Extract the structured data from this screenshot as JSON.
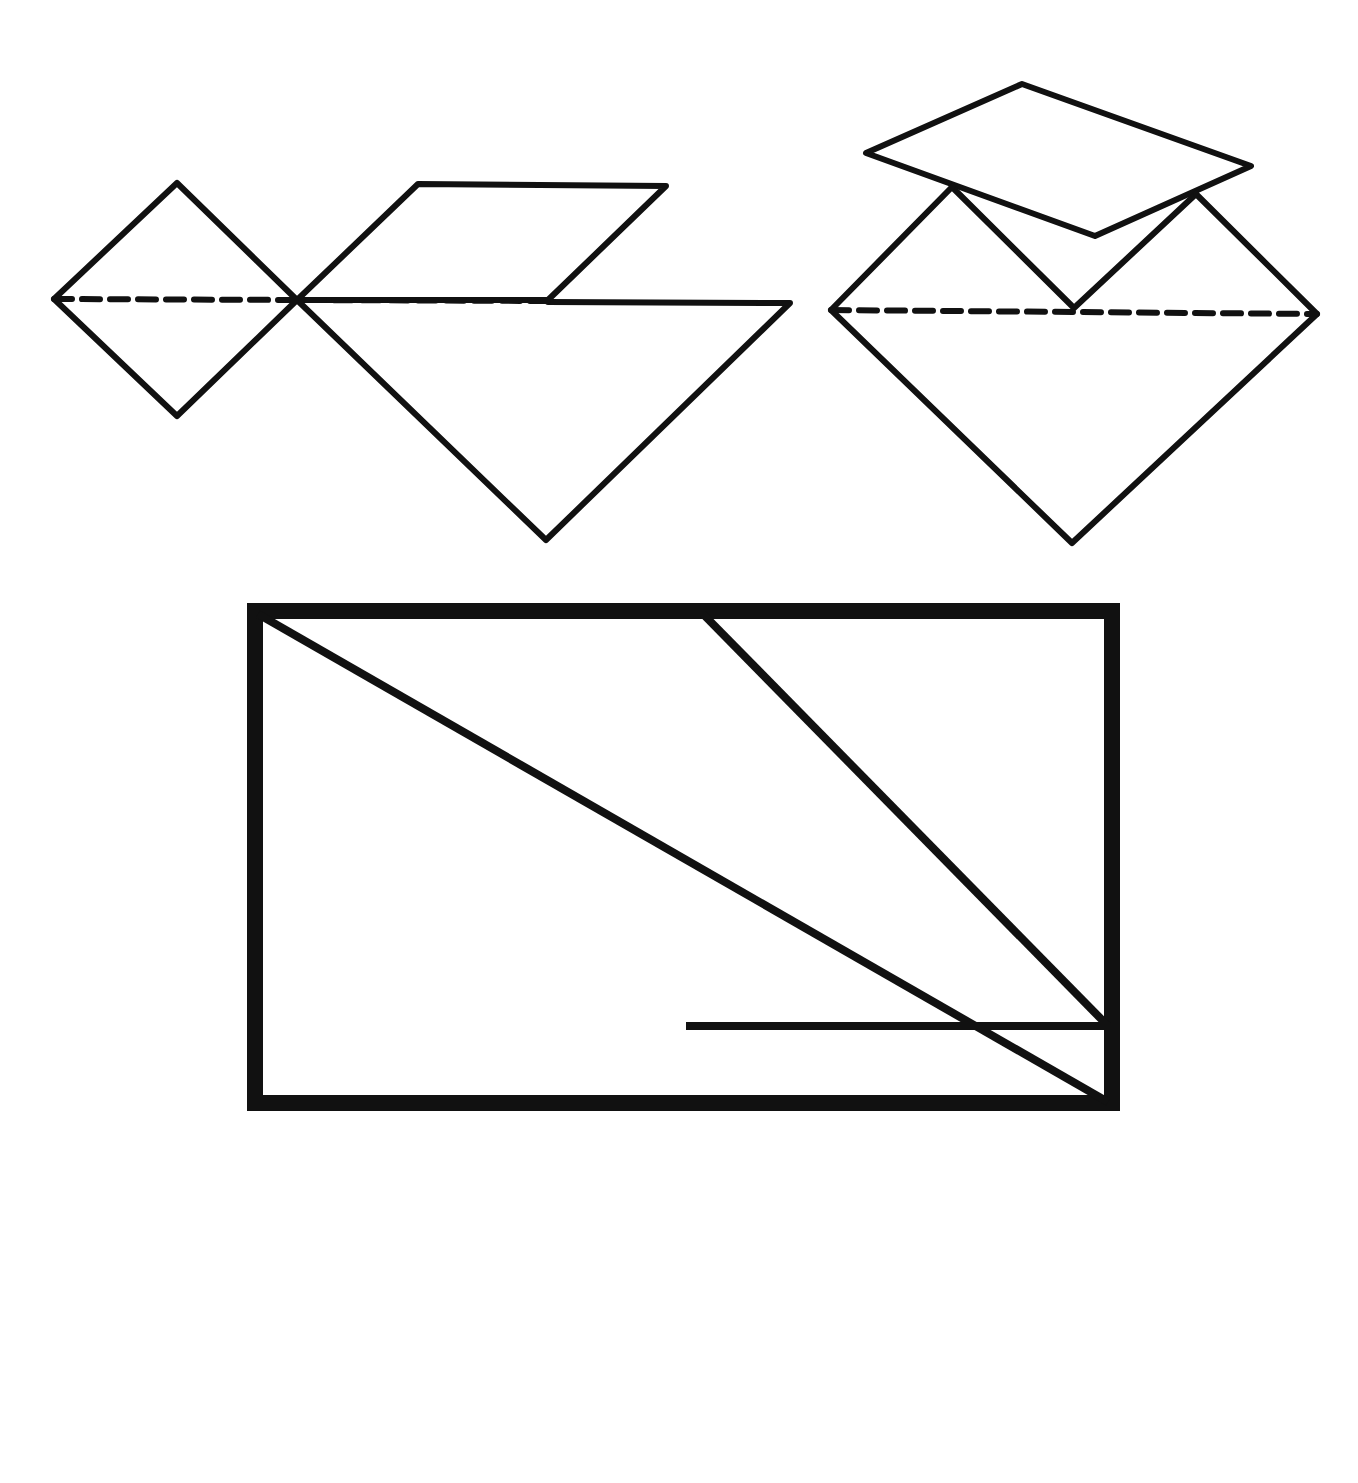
{
  "figure": {
    "background": "#ffffff",
    "stroke_color": "#111111",
    "figures": [
      {
        "name": "left-figure",
        "pieces": [
          "small-square-diamond",
          "parallelogram",
          "large-triangle"
        ],
        "fold_line": "dashed"
      },
      {
        "name": "right-figure",
        "pieces": [
          "rotated-quadrilateral",
          "v-notch",
          "large-diamond"
        ],
        "fold_line": "dashed"
      },
      {
        "name": "dissected-square",
        "pieces": [
          "lower-left-triangle",
          "middle-parallelogram",
          "upper-right-triangle",
          "lower-right-triangle"
        ]
      }
    ]
  }
}
